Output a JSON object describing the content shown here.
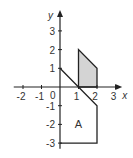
{
  "diagram": {
    "x_axis": {
      "label": "x",
      "range": [
        -2.5,
        3.2
      ],
      "ticks": [
        -2,
        -1,
        0,
        1,
        2,
        3
      ]
    },
    "y_axis": {
      "label": "y",
      "range": [
        -3.3,
        3.9
      ],
      "ticks": [
        -3,
        -2,
        -1,
        1,
        2,
        3
      ]
    },
    "origin_label": "0",
    "shaded_region": {
      "vertices": [
        [
          1,
          0
        ],
        [
          1,
          2
        ],
        [
          2,
          1
        ],
        [
          2,
          0
        ]
      ],
      "fill": "#d4d4d4"
    },
    "region_A": {
      "label": "A",
      "path": [
        [
          0,
          1
        ],
        [
          2,
          -1
        ],
        [
          2,
          -3
        ],
        [
          0,
          -3
        ]
      ],
      "label_pos": [
        1,
        -2
      ]
    },
    "line_color": "#222222"
  }
}
